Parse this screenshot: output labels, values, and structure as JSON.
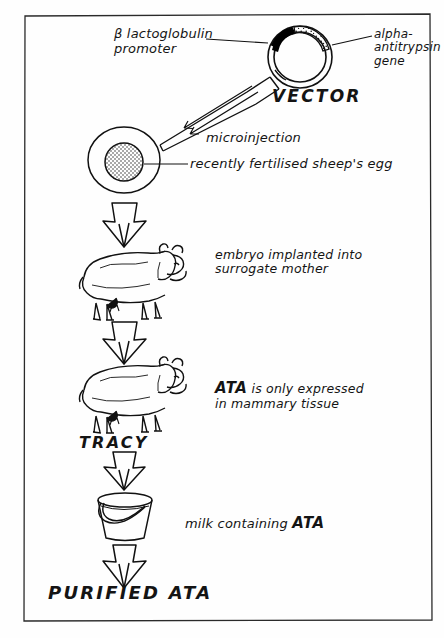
{
  "figure": {
    "kind": "hand-drawn flow diagram",
    "title_text": "",
    "border": "hand-drawn rectangle frame"
  },
  "labels": {
    "promoter": "β lactoglobulin\npromoter",
    "gene": "alpha-\nantitrypsin\ngene",
    "vector": "VECTOR",
    "microinjection": "microinjection",
    "egg": "recently fertilised sheep's egg",
    "embryo_implant": "embryo implanted into\nsurrogate mother",
    "expression_lead": "ATA",
    "expression_rest": " is only expressed\nin mammary tissue",
    "tracy": "TRACY",
    "milk_prefix": "milk containing ",
    "milk_ata": "ATA",
    "purified": "PURIFIED ATA"
  },
  "steps": [
    {
      "id": "vector",
      "name": "plasmid vector"
    },
    {
      "id": "microinjection",
      "name": "microinjection into fertilised egg"
    },
    {
      "id": "surrogate",
      "name": "embryo implanted into surrogate mother"
    },
    {
      "id": "tracy",
      "name": "transgenic sheep Tracy"
    },
    {
      "id": "milk",
      "name": "milk containing ATA"
    },
    {
      "id": "purified",
      "name": "purified ATA"
    }
  ],
  "icons": {
    "plasmid": "plasmid-ring-icon",
    "pipette": "micropipette-icon",
    "egg": "egg-cell-icon",
    "sheep": "sheep-icon",
    "bucket": "bucket-icon",
    "arrow": "block-arrow-down-icon"
  },
  "colors": {
    "ink": "#111111",
    "paper": "#fefefe",
    "promoter_fill": "#000000"
  }
}
